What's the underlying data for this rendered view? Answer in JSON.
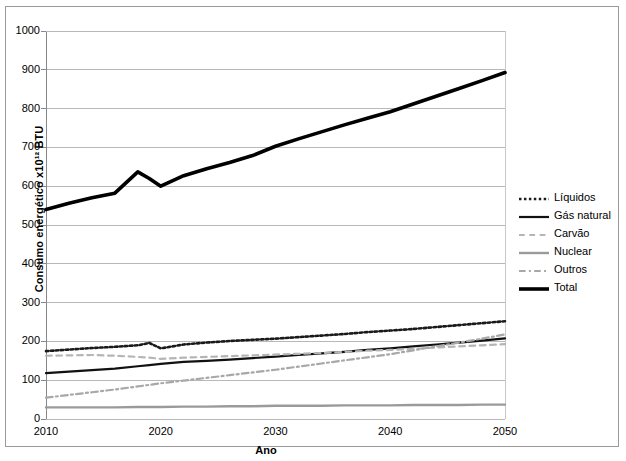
{
  "chart_data": {
    "type": "line",
    "title": "",
    "xlabel": "Ano",
    "ylabel": "Consumo energético x10¹² BTU",
    "xlim": [
      2010,
      2050
    ],
    "ylim": [
      0,
      1000
    ],
    "ytick_labels": [
      "0",
      "100",
      "200",
      "300",
      "400",
      "500",
      "600",
      "700",
      "800",
      "900",
      "1000"
    ],
    "ytick_values": [
      0,
      100,
      200,
      300,
      400,
      500,
      600,
      700,
      800,
      900,
      1000
    ],
    "xtick_labels": [
      "2010",
      "2020",
      "2030",
      "2040",
      "2050"
    ],
    "xtick_values": [
      2010,
      2020,
      2030,
      2040,
      2050
    ],
    "grid": "horizontal",
    "legend_position": "right",
    "x": [
      2010,
      2012,
      2014,
      2016,
      2018,
      2019,
      2020,
      2022,
      2024,
      2026,
      2028,
      2030,
      2032,
      2034,
      2036,
      2038,
      2040,
      2042,
      2044,
      2046,
      2048,
      2050
    ],
    "series": [
      {
        "name": "Líquidos",
        "style": "dotted",
        "color": "#1a1a1a",
        "width": 2.6,
        "values": [
          175,
          179,
          183,
          186,
          190,
          196,
          182,
          192,
          197,
          201,
          204,
          207,
          211,
          215,
          219,
          224,
          228,
          232,
          237,
          242,
          247,
          252
        ]
      },
      {
        "name": "Gás natural",
        "style": "solid",
        "color": "#111111",
        "width": 2.2,
        "values": [
          118,
          122,
          126,
          130,
          136,
          139,
          142,
          147,
          150,
          153,
          157,
          161,
          165,
          169,
          173,
          178,
          182,
          187,
          192,
          197,
          202,
          208
        ]
      },
      {
        "name": "Carvão",
        "style": "dashed",
        "color": "#b5b5b5",
        "width": 2.2,
        "values": [
          163,
          164,
          165,
          163,
          160,
          158,
          155,
          158,
          160,
          162,
          164,
          166,
          168,
          170,
          173,
          176,
          178,
          181,
          184,
          187,
          190,
          193
        ]
      },
      {
        "name": "Nuclear",
        "style": "solid",
        "color": "#9a9a9a",
        "width": 2.4,
        "values": [
          30,
          30,
          30,
          30,
          31,
          31,
          31,
          32,
          32,
          33,
          33,
          34,
          34,
          34,
          35,
          35,
          35,
          36,
          36,
          36,
          37,
          37
        ]
      },
      {
        "name": "Outros",
        "style": "dashdot",
        "color": "#a8a8a8",
        "width": 2.2,
        "values": [
          55,
          62,
          69,
          76,
          84,
          88,
          92,
          99,
          106,
          113,
          120,
          127,
          135,
          143,
          151,
          159,
          167,
          177,
          187,
          197,
          207,
          218
        ]
      },
      {
        "name": "Total",
        "style": "solid",
        "color": "#000000",
        "width": 3.6,
        "values": [
          540,
          556,
          570,
          582,
          637,
          620,
          600,
          627,
          645,
          661,
          679,
          703,
          722,
          740,
          758,
          775,
          792,
          812,
          832,
          852,
          872,
          893
        ]
      }
    ]
  }
}
